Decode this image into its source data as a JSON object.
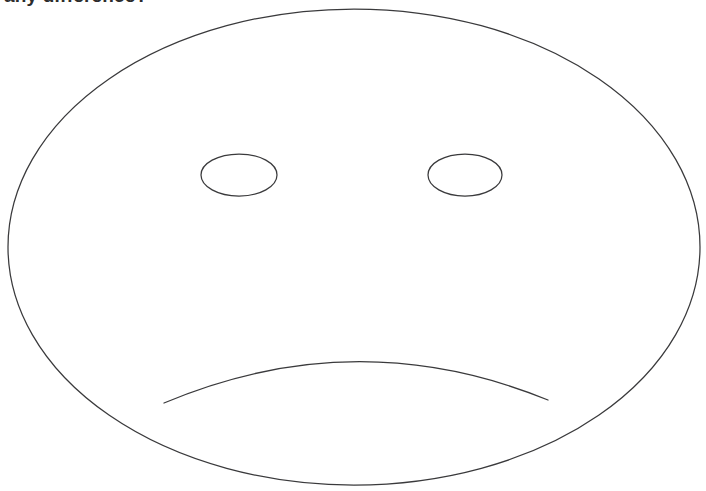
{
  "page": {
    "background_color": "#ffffff",
    "width": 706,
    "height": 491
  },
  "caption": {
    "text": "any difference?",
    "color": "#2c2c2c",
    "clipped_at_top": true
  },
  "drawing": {
    "name": "sad-face-line-drawing",
    "stroke_color": "#3a3a3c",
    "stroke_width": 1.25,
    "fill": "none",
    "face_outline": {
      "shape": "ellipse",
      "cx": 354,
      "cy": 247,
      "rx": 346,
      "ry": 238
    },
    "left_eye": {
      "shape": "ellipse",
      "cx": 239,
      "cy": 175,
      "rx": 38,
      "ry": 21
    },
    "right_eye": {
      "shape": "ellipse",
      "cx": 465,
      "cy": 175,
      "rx": 37,
      "ry": 21
    },
    "mouth": {
      "shape": "arc",
      "expression": "frown",
      "start_x": 164,
      "start_y": 403,
      "end_x": 548,
      "end_y": 400,
      "apex_x": 355,
      "apex_y": 353,
      "path": "M 164 403 Q 356 322 548 400"
    }
  }
}
